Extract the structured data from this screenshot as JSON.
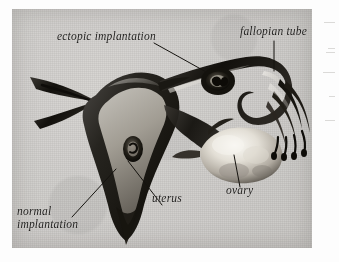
{
  "figure": {
    "medium": "scanned textbook halftone plate",
    "plate_color": "#cdcbc8",
    "ink_color": "#1b1a19"
  },
  "labels": {
    "ectopic_implantation": "ectopic implantation",
    "fallopian_tube": "fallopian tube",
    "ovary": "ovary",
    "uterus": "uterus",
    "normal_implantation_line1": "normal",
    "normal_implantation_line2": "implantation"
  },
  "structures": [
    {
      "name": "uterus",
      "description": "dark pear-shaped muscular body with pale triangular inner cavity"
    },
    {
      "name": "fallopian tube",
      "description": "long curving duct running right from the uterine horn"
    },
    {
      "name": "ovary",
      "description": "pale lumpy ovoid mass below the tube"
    },
    {
      "name": "fimbriae",
      "description": "dark finger-like fringes at the open end of the tube"
    },
    {
      "name": "ectopic embryo",
      "description": "dark oval swelling embedded in the fallopian tube"
    },
    {
      "name": "normal embryo",
      "description": "small dark oval embedded in the uterine cavity"
    },
    {
      "name": "cervix",
      "description": "tapering neck descending from the uterus"
    },
    {
      "name": "round ligament",
      "description": "forked dark projection extending to the left"
    }
  ]
}
